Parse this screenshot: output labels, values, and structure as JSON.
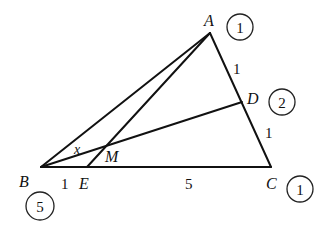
{
  "diagram": {
    "type": "geometry-triangle",
    "points": {
      "A": {
        "label": "A",
        "x": 210,
        "y": 33
      },
      "B": {
        "label": "B",
        "x": 41,
        "y": 167
      },
      "C": {
        "label": "C",
        "x": 271,
        "y": 167
      },
      "D": {
        "label": "D",
        "x": 242,
        "y": 102
      },
      "E": {
        "label": "E",
        "x": 87,
        "y": 167
      },
      "M": {
        "label": "M",
        "x": 105,
        "y": 148
      }
    },
    "segments": [
      "AB",
      "AC",
      "BC",
      "BD",
      "AE"
    ],
    "segment_labels": {
      "AD": "1",
      "DC": "1",
      "BE": "1",
      "EC": "5"
    },
    "angle_label": "x",
    "mass_points": {
      "A": "1",
      "D": "2",
      "C": "1",
      "B": "5"
    }
  }
}
